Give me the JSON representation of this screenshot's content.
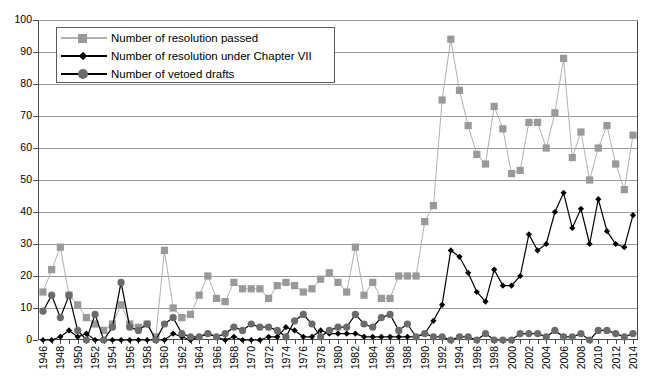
{
  "chart_data": {
    "type": "line",
    "title": "",
    "xlabel": "",
    "ylabel": "",
    "ylim": [
      0,
      100
    ],
    "yticks": [
      0,
      10,
      20,
      30,
      40,
      50,
      60,
      70,
      80,
      90,
      100
    ],
    "grid": true,
    "legend_position": "top-left",
    "x": [
      1946,
      1947,
      1948,
      1949,
      1950,
      1951,
      1952,
      1953,
      1954,
      1955,
      1956,
      1957,
      1958,
      1959,
      1960,
      1961,
      1962,
      1963,
      1964,
      1965,
      1966,
      1967,
      1968,
      1969,
      1970,
      1971,
      1972,
      1973,
      1974,
      1975,
      1976,
      1977,
      1978,
      1979,
      1980,
      1981,
      1982,
      1983,
      1984,
      1985,
      1986,
      1987,
      1988,
      1989,
      1990,
      1991,
      1992,
      1993,
      1994,
      1995,
      1996,
      1997,
      1998,
      1999,
      2000,
      2001,
      2002,
      2003,
      2004,
      2005,
      2006,
      2007,
      2008,
      2009,
      2010,
      2011,
      2012,
      2013,
      2014
    ],
    "xtick_labels": [
      1946,
      1948,
      1950,
      1952,
      1954,
      1956,
      1958,
      1960,
      1962,
      1964,
      1966,
      1968,
      1970,
      1972,
      1974,
      1976,
      1978,
      1980,
      1982,
      1984,
      1986,
      1988,
      1990,
      1992,
      1994,
      1996,
      1998,
      2000,
      2002,
      2004,
      2006,
      2008,
      2010,
      2012,
      2014
    ],
    "series": [
      {
        "name": "Number of resolution passed",
        "color": "#999999",
        "marker": "square",
        "values": [
          15,
          22,
          29,
          14,
          11,
          7,
          5,
          3,
          5,
          11,
          5,
          4,
          5,
          1,
          28,
          10,
          7,
          8,
          14,
          20,
          13,
          12,
          18,
          16,
          16,
          16,
          13,
          17,
          18,
          17,
          15,
          16,
          19,
          21,
          18,
          15,
          29,
          14,
          18,
          13,
          13,
          20,
          20,
          20,
          37,
          42,
          75,
          94,
          78,
          67,
          58,
          55,
          73,
          66,
          52,
          53,
          68,
          68,
          60,
          71,
          88,
          57,
          65,
          50,
          60,
          67,
          55,
          47,
          64
        ]
      },
      {
        "name": "Number of resolution under Chapter VII",
        "color": "#000000",
        "marker": "diamond",
        "values": [
          0,
          0,
          1,
          3,
          1,
          2,
          0,
          0,
          0,
          0,
          0,
          0,
          0,
          0,
          0,
          2,
          1,
          0,
          1,
          2,
          1,
          0,
          1,
          0,
          0,
          0,
          1,
          1,
          4,
          3,
          1,
          1,
          3,
          2,
          2,
          2,
          2,
          1,
          1,
          1,
          1,
          1,
          1,
          1,
          2,
          6,
          11,
          28,
          26,
          21,
          15,
          12,
          22,
          17,
          17,
          20,
          33,
          28,
          30,
          40,
          46,
          35,
          41,
          30,
          44,
          34,
          30,
          29,
          39
        ]
      },
      {
        "name": "Number of vetoed drafts",
        "color": "#6b6b6b",
        "marker": "circle",
        "values": [
          9,
          14,
          7,
          14,
          3,
          0,
          8,
          0,
          4,
          18,
          4,
          3,
          5,
          0,
          5,
          7,
          2,
          1,
          1,
          2,
          1,
          2,
          4,
          3,
          5,
          4,
          4,
          3,
          1,
          6,
          8,
          5,
          1,
          3,
          4,
          4,
          8,
          5,
          4,
          7,
          8,
          3,
          5,
          1,
          2,
          1,
          1,
          0,
          1,
          1,
          0,
          2,
          0,
          0,
          0,
          2,
          2,
          2,
          1,
          3,
          1,
          1,
          2,
          0,
          3,
          3,
          2,
          1,
          2
        ]
      }
    ]
  },
  "legend": {
    "items": [
      {
        "label": "Number of resolution passed"
      },
      {
        "label": "Number of resolution under Chapter VII"
      },
      {
        "label": "Number of vetoed drafts"
      }
    ]
  }
}
